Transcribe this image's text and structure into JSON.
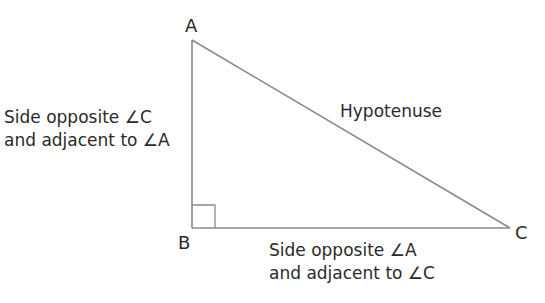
{
  "diagram": {
    "type": "right-triangle",
    "vertices": {
      "A": {
        "label": "A",
        "x": 192,
        "y": 40
      },
      "B": {
        "label": "B",
        "x": 192,
        "y": 228
      },
      "C": {
        "label": "C",
        "x": 510,
        "y": 228
      }
    },
    "right_angle_at": "B",
    "line_color": "#8a8a8a",
    "labels": {
      "hypotenuse": "Hypotenuse",
      "side_ab_line1": "Side opposite ∠C",
      "side_ab_line2": "and adjacent to ∠A",
      "side_bc_line1": "Side opposite ∠A",
      "side_bc_line2": "and adjacent to ∠C"
    }
  }
}
